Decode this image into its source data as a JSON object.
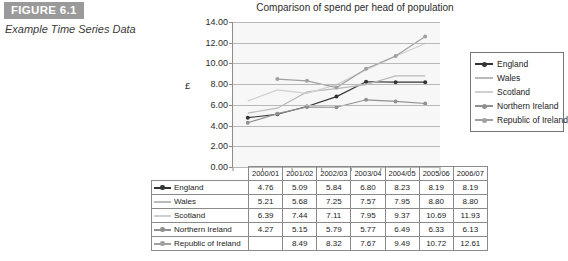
{
  "figure": {
    "banner_label": "FIGURE 6.1",
    "caption": "Example Time Series Data",
    "banner_color": "#9a9a9a"
  },
  "chart_data": {
    "type": "line",
    "title": "Comparison of spend per head of population",
    "xlabel": "",
    "ylabel": "£",
    "ylim": [
      0,
      14
    ],
    "ytick_labels": [
      "14.00",
      "12.00",
      "10.00",
      "8.00",
      "6.00",
      "4.00",
      "2.00",
      "0.00"
    ],
    "ytick_values": [
      14,
      12,
      10,
      8,
      6,
      4,
      2,
      0
    ],
    "grid": true,
    "legend_position": "right",
    "categories": [
      "2000/01",
      "2001/02",
      "2002/03",
      "2003/04",
      "2004/05",
      "2005/06",
      "2006/07"
    ],
    "series": [
      {
        "name": "England",
        "color": "#333333",
        "marker": "dot",
        "values": [
          4.76,
          5.09,
          5.84,
          6.8,
          8.23,
          8.19,
          8.19
        ],
        "labels": [
          "4.76",
          "5.09",
          "5.84",
          "6.80",
          "8.23",
          "8.19",
          "8.19"
        ]
      },
      {
        "name": "Wales",
        "color": "#b9b9b9",
        "marker": "none",
        "values": [
          5.21,
          5.68,
          7.25,
          7.57,
          7.95,
          8.8,
          8.8
        ],
        "labels": [
          "5.21",
          "5.68",
          "7.25",
          "7.57",
          "7.95",
          "8.80",
          "8.80"
        ]
      },
      {
        "name": "Scotland",
        "color": "#cfcfcf",
        "marker": "none",
        "values": [
          6.39,
          7.44,
          7.11,
          7.95,
          9.37,
          10.69,
          11.93
        ],
        "labels": [
          "6.39",
          "7.44",
          "7.11",
          "7.95",
          "9.37",
          "10.69",
          "11.93"
        ]
      },
      {
        "name": "Northern Ireland",
        "color": "#909090",
        "marker": "dot",
        "values": [
          4.27,
          5.15,
          5.79,
          5.77,
          6.49,
          6.33,
          6.13
        ],
        "labels": [
          "4.27",
          "5.15",
          "5.79",
          "5.77",
          "6.49",
          "6.33",
          "6.13"
        ]
      },
      {
        "name": "Republic of Ireland",
        "color": "#a0a0a0",
        "marker": "dot",
        "values": [
          null,
          8.49,
          8.32,
          7.67,
          9.49,
          10.72,
          12.61
        ],
        "labels": [
          "",
          "8.49",
          "8.32",
          "7.67",
          "9.49",
          "10.72",
          "12.61"
        ]
      }
    ]
  },
  "table": {
    "corner_label": "",
    "headers": [
      "2000/01",
      "2001/02",
      "2002/03",
      "2003/04",
      "2004/05",
      "2005/06",
      "2006/07"
    ],
    "rows": [
      {
        "label": "England",
        "values": [
          "4.76",
          "5.09",
          "5.84",
          "6.80",
          "8.23",
          "8.19",
          "8.19"
        ]
      },
      {
        "label": "Wales",
        "values": [
          "5.21",
          "5.68",
          "7.25",
          "7.57",
          "7.95",
          "8.80",
          "8.80"
        ]
      },
      {
        "label": "Scotland",
        "values": [
          "6.39",
          "7.44",
          "7.11",
          "7.95",
          "9.37",
          "10.69",
          "11.93"
        ]
      },
      {
        "label": "Northern Ireland",
        "values": [
          "4.27",
          "5.15",
          "5.79",
          "5.77",
          "6.49",
          "6.33",
          "6.13"
        ]
      },
      {
        "label": "Republic of Ireland",
        "values": [
          "",
          "8.49",
          "8.32",
          "7.67",
          "9.49",
          "10.72",
          "12.61"
        ]
      }
    ]
  }
}
